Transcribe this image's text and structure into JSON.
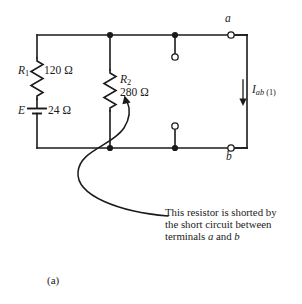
{
  "figure": {
    "label": "(a)",
    "background_color": "#ffffff",
    "line_color": "#1a1a1a"
  },
  "circuit": {
    "type": "schematic",
    "components": [
      {
        "id": "R1",
        "kind": "resistor",
        "designator": "R",
        "designator_sub": "1",
        "value": "120 Ω",
        "orientation": "vertical",
        "branch": "left"
      },
      {
        "id": "E",
        "kind": "voltage-source",
        "designator": "E",
        "value": "24 Ω",
        "orientation": "vertical",
        "branch": "left"
      },
      {
        "id": "R2",
        "kind": "resistor",
        "designator": "R",
        "designator_sub": "2",
        "value": "280 Ω",
        "orientation": "vertical",
        "branch": "middle"
      }
    ],
    "terminals": [
      {
        "id": "a",
        "label": "a",
        "position": "top-right"
      },
      {
        "id": "b",
        "label": "b",
        "position": "bottom-right"
      }
    ],
    "current": {
      "symbol": "I",
      "sub": "ab",
      "sub_paren": "(1)",
      "direction": "down",
      "branch": "right"
    },
    "short_circuit": {
      "description": "open-circle pair on middle-right branch forming short between a and b"
    }
  },
  "annotation": {
    "lines": [
      "This resistor is shorted by",
      "the short circuit between",
      "terminals a and b"
    ],
    "line3_pre": "terminals ",
    "line3_a": "a",
    "line3_mid": " and ",
    "line3_b": "b",
    "pointer": "curved-arrow-to-R2"
  }
}
